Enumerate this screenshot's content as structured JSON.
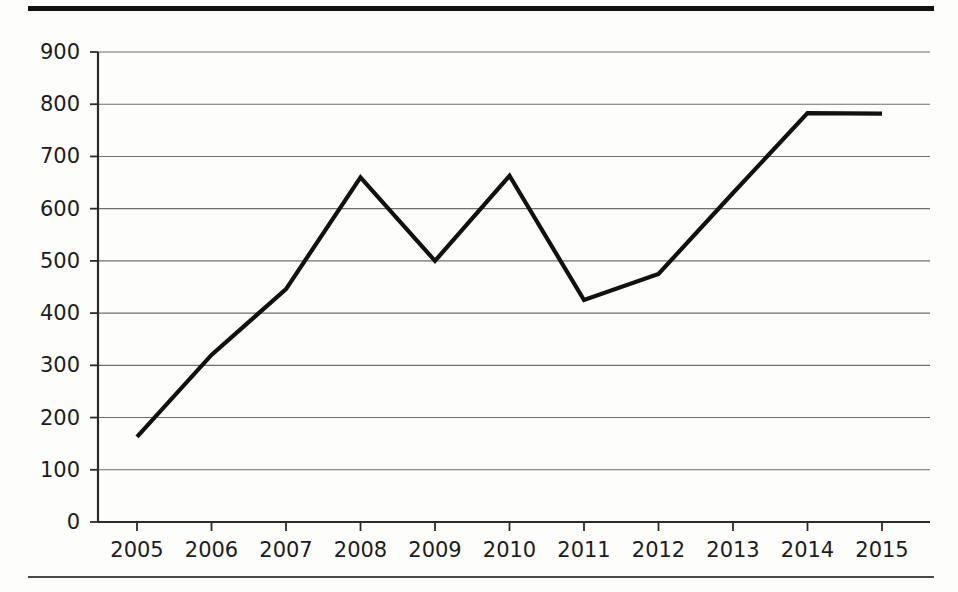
{
  "figure": {
    "background_color": "#fdfdfc",
    "rule_color_top": "#111111",
    "rule_color_bottom": "#4a4a4a"
  },
  "chart_data": {
    "type": "line",
    "title": "",
    "subtitle": "",
    "xlabel": "",
    "ylabel": "",
    "categories": [
      "2005",
      "2006",
      "2007",
      "2008",
      "2009",
      "2010",
      "2011",
      "2012",
      "2013",
      "2014",
      "2015"
    ],
    "x": [
      2005,
      2006,
      2007,
      2008,
      2009,
      2010,
      2011,
      2012,
      2013,
      2014,
      2015
    ],
    "values": [
      163,
      320,
      446,
      660,
      500,
      663,
      425,
      475,
      630,
      783,
      782
    ],
    "series": [
      {
        "name": "",
        "color": "#111111",
        "values": [
          163,
          320,
          446,
          660,
          500,
          663,
          425,
          475,
          630,
          783,
          782
        ]
      }
    ],
    "ylim": [
      0,
      900
    ],
    "ytick_values": [
      0,
      100,
      200,
      300,
      400,
      500,
      600,
      700,
      800,
      900
    ],
    "ytick_labels": [
      "0",
      "100",
      "200",
      "300",
      "400",
      "500",
      "600",
      "700",
      "800",
      "900"
    ],
    "xtick_labels": [
      "2005",
      "2006",
      "2007",
      "2008",
      "2009",
      "2010",
      "2011",
      "2012",
      "2013",
      "2014",
      "2015"
    ],
    "grid": "horizontal",
    "grid_color": "#6f6f6f",
    "legend": "none",
    "legend_position": "none",
    "annotations": []
  }
}
